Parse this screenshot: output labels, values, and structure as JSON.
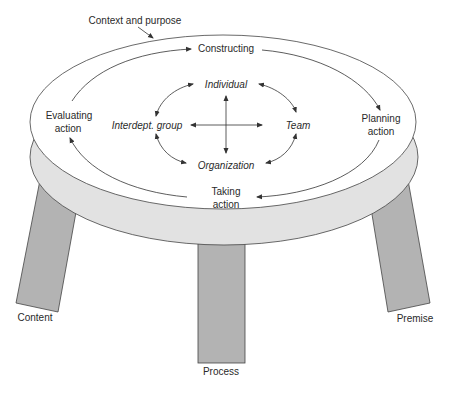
{
  "diagram": {
    "outer_label": "Context and purpose",
    "cycle": {
      "top": "Constructing",
      "right_line1": "Planning",
      "right_line2": "action",
      "bottom_line1": "Taking",
      "bottom_line2": "action",
      "left_line1": "Evaluating",
      "left_line2": "action"
    },
    "levels": {
      "top": "Individual",
      "right": "Team",
      "bottom": "Organization",
      "left": "Interdept. group"
    },
    "legs": {
      "left": "Content",
      "center": "Process",
      "right": "Premise"
    },
    "colors": {
      "tabletop": "#ffffff",
      "table_edge": "#e2e2e2",
      "legs": "#b3b3b3",
      "stroke": "#333333"
    }
  }
}
